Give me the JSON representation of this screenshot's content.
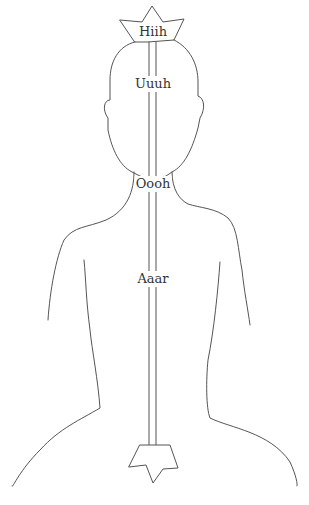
{
  "diagram": {
    "type": "body-outline-chakra",
    "stroke_color": "#555555",
    "labels": [
      {
        "id": "crown",
        "text": "Hiih",
        "x": 153,
        "y": 24
      },
      {
        "id": "head",
        "text": "Uuuh",
        "x": 153,
        "y": 76
      },
      {
        "id": "throat",
        "text": "Oooh",
        "x": 153,
        "y": 176
      },
      {
        "id": "heart",
        "text": "Aaar",
        "x": 153,
        "y": 271
      }
    ],
    "symbols": [
      {
        "id": "crown-star",
        "position": "top"
      },
      {
        "id": "root-star",
        "position": "bottom"
      }
    ]
  }
}
